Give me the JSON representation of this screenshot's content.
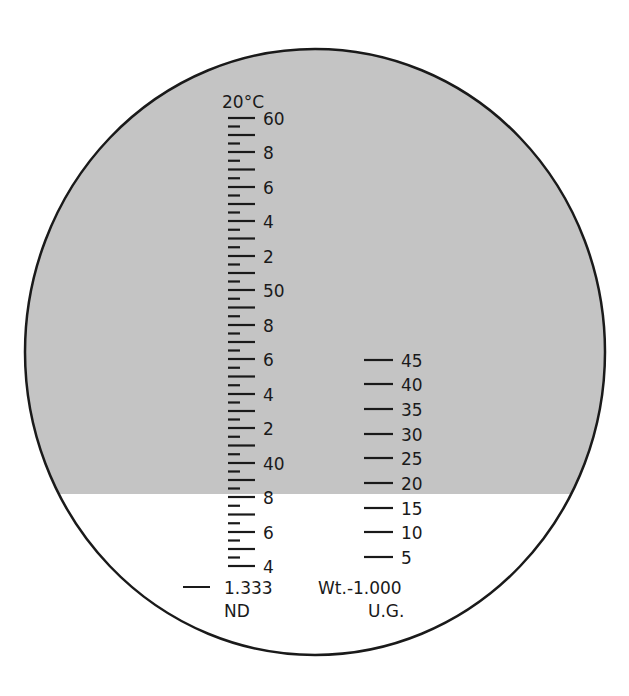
{
  "colors": {
    "shade": "#c4c4c4",
    "light": "#ffffff",
    "ink": "#1a1a1a"
  },
  "left_scale": {
    "header": "20°C",
    "labels": [
      {
        "text": "60",
        "y": 118
      },
      {
        "text": "8",
        "y": 152
      },
      {
        "text": "6",
        "y": 187
      },
      {
        "text": "4",
        "y": 221
      },
      {
        "text": "2",
        "y": 256
      },
      {
        "text": "50",
        "y": 290
      },
      {
        "text": "8",
        "y": 325
      },
      {
        "text": "6",
        "y": 359
      },
      {
        "text": "4",
        "y": 394
      },
      {
        "text": "2",
        "y": 428
      },
      {
        "text": "40",
        "y": 463
      },
      {
        "text": "8",
        "y": 497
      },
      {
        "text": "6",
        "y": 532
      },
      {
        "text": "4",
        "y": 566
      }
    ],
    "reference_value": "1.333",
    "unit": "ND"
  },
  "right_scale": {
    "labels": [
      {
        "text": "45",
        "y": 360
      },
      {
        "text": "40",
        "y": 384
      },
      {
        "text": "35",
        "y": 409
      },
      {
        "text": "30",
        "y": 434
      },
      {
        "text": "25",
        "y": 458
      },
      {
        "text": "20",
        "y": 483
      },
      {
        "text": "15",
        "y": 508
      },
      {
        "text": "10",
        "y": 532
      },
      {
        "text": "5",
        "y": 557
      }
    ],
    "reference_value": "Wt.-1.000",
    "unit": "U.G."
  },
  "boundary_y": 494
}
